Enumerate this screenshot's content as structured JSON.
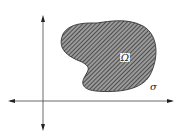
{
  "diagram": {
    "region_label": "Ω",
    "boundary_label": "σ",
    "axes": {
      "horizontal": "bidirectional-arrow",
      "vertical": "bidirectional-arrow"
    },
    "colors": {
      "line": "#333333",
      "hatch": "#4a4a4a",
      "fill": "#ffffff"
    }
  }
}
